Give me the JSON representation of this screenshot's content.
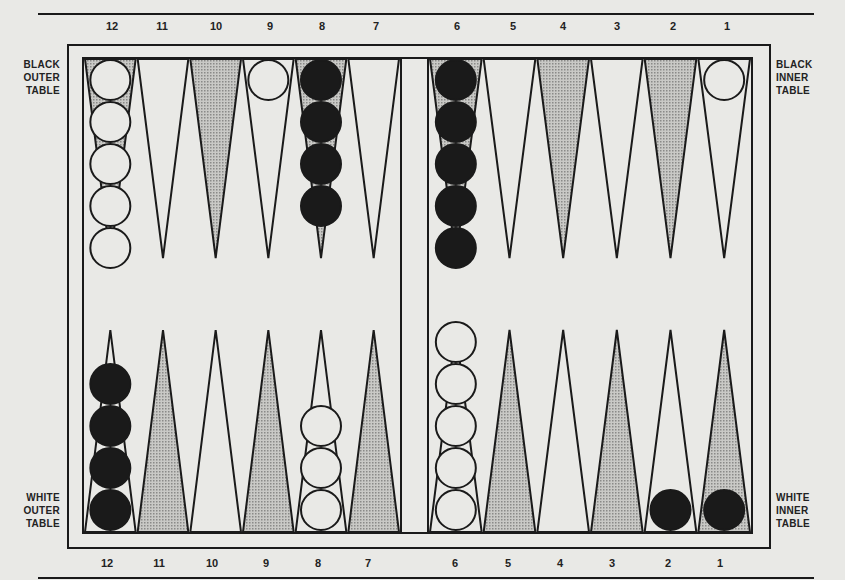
{
  "labels": {
    "black_outer": [
      "BLACK",
      "OUTER",
      "TABLE"
    ],
    "black_inner": [
      "BLACK",
      "INNER",
      "TABLE"
    ],
    "white_outer": [
      "WHITE",
      "OUTER",
      "TABLE"
    ],
    "white_inner": [
      "WHITE",
      "INNER",
      "TABLE"
    ]
  },
  "top_numbers": [
    "12",
    "11",
    "10",
    "9",
    "8",
    "7",
    "6",
    "5",
    "4",
    "3",
    "2",
    "1"
  ],
  "bottom_numbers": [
    "12",
    "11",
    "10",
    "9",
    "8",
    "7",
    "6",
    "5",
    "4",
    "3",
    "2",
    "1"
  ],
  "colors": {
    "ink": "#1a1a1a",
    "paper": "#e9e9e6",
    "shaded_point": "#b9b9b6"
  },
  "board": {
    "top_points": [
      {
        "point": "12",
        "shaded": true,
        "checkers": {
          "color": "white",
          "count": 5
        }
      },
      {
        "point": "11",
        "shaded": false,
        "checkers": null
      },
      {
        "point": "10",
        "shaded": true,
        "checkers": null
      },
      {
        "point": "9",
        "shaded": false,
        "checkers": {
          "color": "white",
          "count": 1
        }
      },
      {
        "point": "8",
        "shaded": true,
        "checkers": {
          "color": "black",
          "count": 4
        }
      },
      {
        "point": "7",
        "shaded": false,
        "checkers": null
      },
      {
        "point": "6",
        "shaded": true,
        "checkers": {
          "color": "black",
          "count": 5
        }
      },
      {
        "point": "5",
        "shaded": false,
        "checkers": null
      },
      {
        "point": "4",
        "shaded": true,
        "checkers": null
      },
      {
        "point": "3",
        "shaded": false,
        "checkers": null
      },
      {
        "point": "2",
        "shaded": true,
        "checkers": null
      },
      {
        "point": "1",
        "shaded": false,
        "checkers": {
          "color": "white",
          "count": 1
        }
      }
    ],
    "bottom_points": [
      {
        "point": "12",
        "shaded": false,
        "checkers": {
          "color": "black",
          "count": 4
        }
      },
      {
        "point": "11",
        "shaded": true,
        "checkers": null
      },
      {
        "point": "10",
        "shaded": false,
        "checkers": null
      },
      {
        "point": "9",
        "shaded": true,
        "checkers": null
      },
      {
        "point": "8",
        "shaded": false,
        "checkers": {
          "color": "white",
          "count": 3
        }
      },
      {
        "point": "7",
        "shaded": true,
        "checkers": null
      },
      {
        "point": "6",
        "shaded": false,
        "checkers": {
          "color": "white",
          "count": 5
        }
      },
      {
        "point": "5",
        "shaded": true,
        "checkers": null
      },
      {
        "point": "4",
        "shaded": false,
        "checkers": null
      },
      {
        "point": "3",
        "shaded": true,
        "checkers": null
      },
      {
        "point": "2",
        "shaded": false,
        "checkers": {
          "color": "black",
          "count": 1
        }
      },
      {
        "point": "1",
        "shaded": true,
        "checkers": {
          "color": "black",
          "count": 1
        }
      }
    ]
  }
}
